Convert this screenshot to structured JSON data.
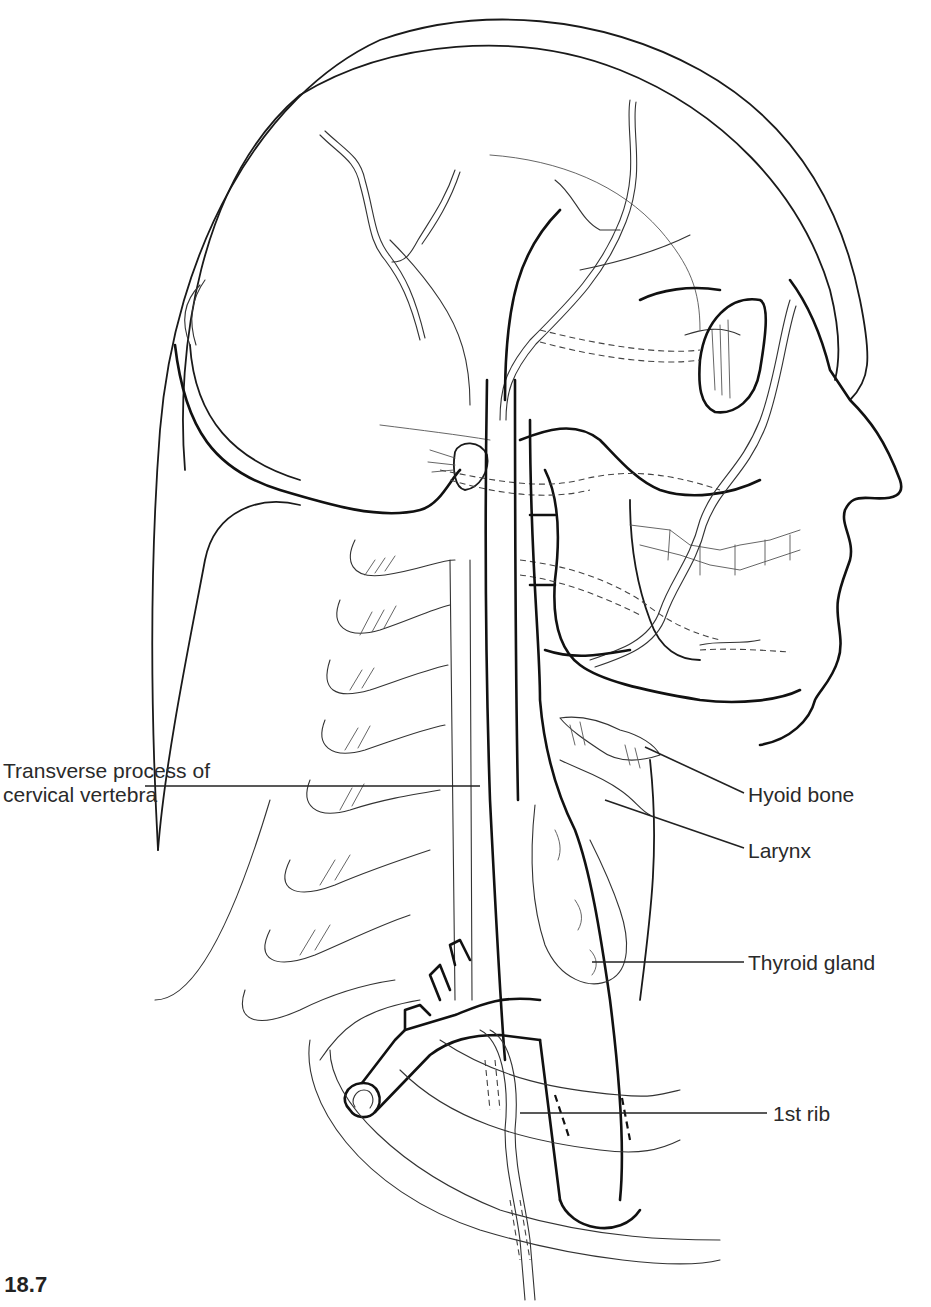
{
  "figure": {
    "caption": "e 18.7"
  },
  "labels": {
    "transverse_process": "Transverse process of cervical vertebra",
    "hyoid_bone": "Hyoid bone",
    "larynx": "Larynx",
    "thyroid_gland": "Thyroid gland",
    "first_rib": "1st rib"
  },
  "colors": {
    "line": "#111111",
    "background": "#ffffff",
    "text": "#2a2a2a"
  }
}
